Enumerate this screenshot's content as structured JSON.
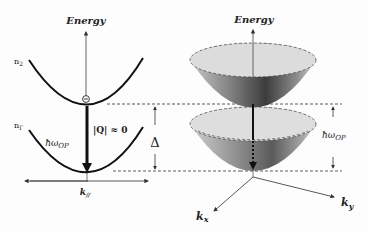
{
  "left_panel": {
    "axis_label": "Energy",
    "upper_band_label": "n",
    "upper_band_sub": "2",
    "lower_band_label": "n",
    "lower_band_sub": "Γ",
    "electron_symbol": "⊝",
    "transition_label": "ħω",
    "transition_sub": "OP",
    "momentum_label": "|Q| ≈ 0",
    "horizontal_axis_label": "k",
    "horizontal_axis_sub": "//"
  },
  "gap": {
    "label": "Δ"
  },
  "right_panel": {
    "axis_label": "Energy",
    "energy_gap_label": "ħω",
    "energy_gap_sub": "OP",
    "kx_label": "k",
    "kx_sub": "x",
    "ky_label": "k",
    "ky_sub": "y"
  },
  "colors": {
    "line": "#1a1a1a",
    "rim": "#d9d9d9",
    "shade_dark": "#3a3a3a",
    "shade_light": "#bdbdbd"
  }
}
